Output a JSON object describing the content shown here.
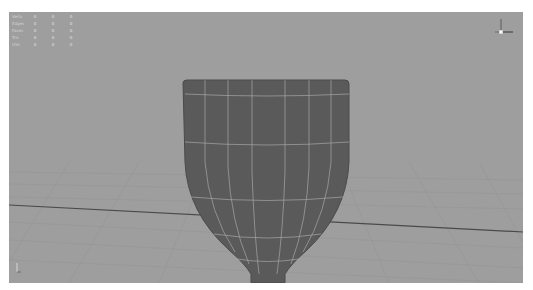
{
  "viewport": {
    "background": "#9e9e9e",
    "grid_color": "#949494",
    "axis_line_color": "#4a4a4a",
    "model": {
      "name": "goblet-cup",
      "fill": "#5a5a5a",
      "wire": "#b8b8b8"
    }
  },
  "hud": {
    "rows": [
      {
        "label": "Verts",
        "values": [
          "0",
          "0",
          "0"
        ]
      },
      {
        "label": "Edges",
        "values": [
          "0",
          "0",
          "0"
        ]
      },
      {
        "label": "Faces",
        "values": [
          "0",
          "0",
          "0"
        ]
      },
      {
        "label": "Tris",
        "values": [
          "0",
          "0",
          "0"
        ]
      },
      {
        "label": "UVs",
        "values": [
          "0",
          "0",
          "0"
        ]
      }
    ]
  },
  "axis_gizmo": {
    "x_label": "x",
    "y_label": "y",
    "z_label": "z"
  }
}
